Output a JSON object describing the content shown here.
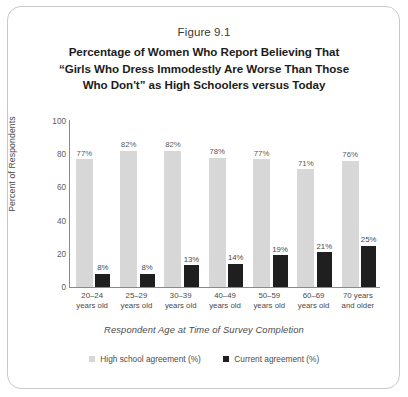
{
  "figure": {
    "number": "Figure 9.1",
    "title_lines": [
      "Percentage of Women Who Report Believing That",
      "“Girls Who Dress Immodestly Are Worse Than Those",
      "Who Don't” as High Schoolers versus Today"
    ]
  },
  "chart_data": {
    "type": "bar",
    "title": "Percentage of Women Who Report Believing That “Girls Who Dress Immodestly Are Worse Than Those Who Don't” as High Schoolers versus Today",
    "xlabel": "Respondent Age at Time of Survey Completion",
    "ylabel": "Percent of Respondents",
    "ylim": [
      0,
      100
    ],
    "yticks": [
      0,
      20,
      40,
      60,
      80,
      100
    ],
    "grid": false,
    "legend_position": "bottom",
    "categories": [
      [
        "20–24",
        "years old"
      ],
      [
        "25–29",
        "years old"
      ],
      [
        "30–39",
        "years old"
      ],
      [
        "40–49",
        "years old"
      ],
      [
        "50–59",
        "years old"
      ],
      [
        "60–69",
        "years old"
      ],
      [
        "70 years",
        "and older"
      ]
    ],
    "category_labels": [
      "20–24 years old",
      "25–29 years old",
      "30–39 years old",
      "40–49 years old",
      "50–59 years old",
      "60–69 years old",
      "70 years and older"
    ],
    "series": [
      {
        "name": "High school agreement (%)",
        "color": "#d7d7d7",
        "values": [
          77,
          82,
          82,
          78,
          77,
          71,
          76
        ],
        "value_labels": [
          "77%",
          "82%",
          "82%",
          "78%",
          "77%",
          "71%",
          "76%"
        ]
      },
      {
        "name": "Current agreement (%)",
        "color": "#1f1f1f",
        "values": [
          8,
          8,
          13,
          14,
          19,
          21,
          25
        ],
        "value_labels": [
          "8%",
          "8%",
          "13%",
          "14%",
          "19%",
          "21%",
          "25%"
        ]
      }
    ]
  },
  "legend": [
    {
      "label": "High school agreement (%)",
      "swatch": "light"
    },
    {
      "label": "Current agreement (%)",
      "swatch": "dark"
    }
  ],
  "yticks_text": [
    "100",
    "80",
    "60",
    "40",
    "20",
    "0"
  ]
}
